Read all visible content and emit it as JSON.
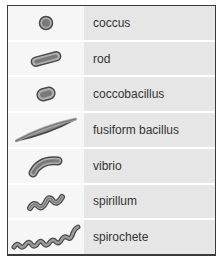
{
  "colors": {
    "border": "#3a3a3a",
    "label_bg": "#e6e6e6",
    "icon_bg": "#f6f6f6",
    "shape_fill": "#8a8a8a",
    "shape_stroke": "#4a4a4a"
  },
  "rows": [
    {
      "label": "coccus",
      "icon": "coccus-icon"
    },
    {
      "label": "rod",
      "icon": "rod-icon"
    },
    {
      "label": "coccobacillus",
      "icon": "coccobacillus-icon"
    },
    {
      "label": "fusiform bacillus",
      "icon": "fusiform-bacillus-icon"
    },
    {
      "label": "vibrio",
      "icon": "vibrio-icon"
    },
    {
      "label": "spirillum",
      "icon": "spirillum-icon"
    },
    {
      "label": "spirochete",
      "icon": "spirochete-icon"
    }
  ]
}
